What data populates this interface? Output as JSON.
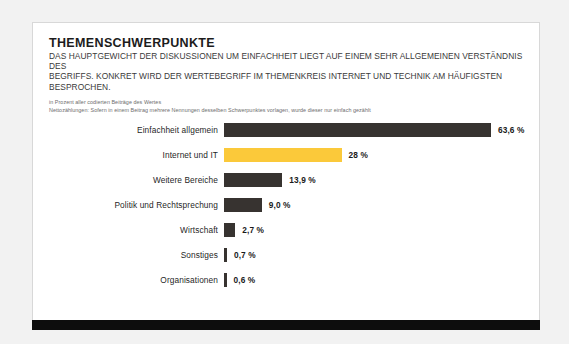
{
  "header": {
    "title": "THEMENSCHWERPUNKTE",
    "subtitle_line1": "DAS HAUPTGEWICHT DER DISKUSSIONEN UM EINFACHHEIT LIEGT AUF EINEM SEHR ALLGEMEINEN VERSTÄNDNIS DES",
    "subtitle_line2": "BEGRIFFS. KONKRET WIRD DER WERTEBEGRIFF IM THEMENKREIS INTERNET UND TECHNIK AM HÄUFIGSTEN BESPROCHEN.",
    "note_line1": "in Prozent aller codierten Beiträge des Wertes",
    "note_line2": "Nettozählungen: Sofern in einem Beitrag mehrere Nennungen desselben Schwerpunktes vorlagen, wurde dieser nur einfach gezählt"
  },
  "colors": {
    "bar_default": "#373330",
    "bar_highlight": "#fbc93a",
    "card_background": "#ffffff",
    "page_background": "#f2f2f2",
    "footer_bar": "#0d0d0d"
  },
  "chart_data": {
    "type": "bar",
    "orientation": "horizontal",
    "title": "THEMENSCHWERPUNKTE",
    "subtitle": "DAS HAUPTGEWICHT DER DISKUSSIONEN UM EINFACHHEIT LIEGT AUF EINEM SEHR ALLGEMEINEN VERSTÄNDNIS DES BEGRIFFS. KONKRET WIRD DER WERTEBEGRIFF IM THEMENKREIS INTERNET UND TECHNIK AM HÄUFIGSTEN BESPROCHEN.",
    "xlabel": "",
    "ylabel": "",
    "unit": "%",
    "xlim": [
      0,
      63.6
    ],
    "grid": false,
    "legend": false,
    "categories": [
      "Einfachheit allgemein",
      "Internet und IT",
      "Weitere Bereiche",
      "Politik und Rechtsprechung",
      "Wirtschaft",
      "Sonstiges",
      "Organisationen"
    ],
    "values": [
      63.6,
      28.0,
      13.9,
      9.0,
      2.7,
      0.7,
      0.6
    ],
    "value_labels": [
      "63,6 %",
      "28 %",
      "13,9 %",
      "9,0 %",
      "2,7 %",
      "0,7 %",
      "0,6 %"
    ],
    "highlight_index": 1,
    "bars": [
      {
        "label": "Einfachheit allgemein",
        "value": 63.6,
        "value_label": "63,6 %",
        "highlight": false
      },
      {
        "label": "Internet und IT",
        "value": 28.0,
        "value_label": "28 %",
        "highlight": true
      },
      {
        "label": "Weitere Bereiche",
        "value": 13.9,
        "value_label": "13,9 %",
        "highlight": false
      },
      {
        "label": "Politik und Rechtsprechung",
        "value": 9.0,
        "value_label": "9,0 %",
        "highlight": false
      },
      {
        "label": "Wirtschaft",
        "value": 2.7,
        "value_label": "2,7 %",
        "highlight": false
      },
      {
        "label": "Sonstiges",
        "value": 0.7,
        "value_label": "0,7 %",
        "highlight": false
      },
      {
        "label": "Organisationen",
        "value": 0.6,
        "value_label": "0,6 %",
        "highlight": false
      }
    ]
  }
}
